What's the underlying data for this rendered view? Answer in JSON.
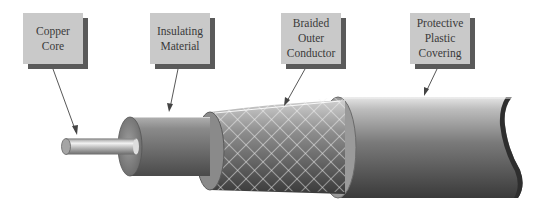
{
  "diagram": {
    "labels": [
      {
        "id": "copper-core",
        "text": "Copper\nCore"
      },
      {
        "id": "insulating-material",
        "text": "Insulating\nMaterial"
      },
      {
        "id": "braided-outer-conductor",
        "text": "Braided\nOuter\nConductor"
      },
      {
        "id": "protective-plastic-covering",
        "text": "Protective\nPlastic\nCovering"
      }
    ],
    "layers": [
      "Copper Core",
      "Insulating Material",
      "Braided Outer Conductor",
      "Protective Plastic Covering"
    ],
    "colors": {
      "label_fill": "#c9c9c9",
      "label_shadow": "#5a5a5a",
      "label_text": "#3a3a3a",
      "cable_dark": "#3c3c3c",
      "cable_light": "#bdbdbd",
      "leader_line": "#444444"
    }
  }
}
